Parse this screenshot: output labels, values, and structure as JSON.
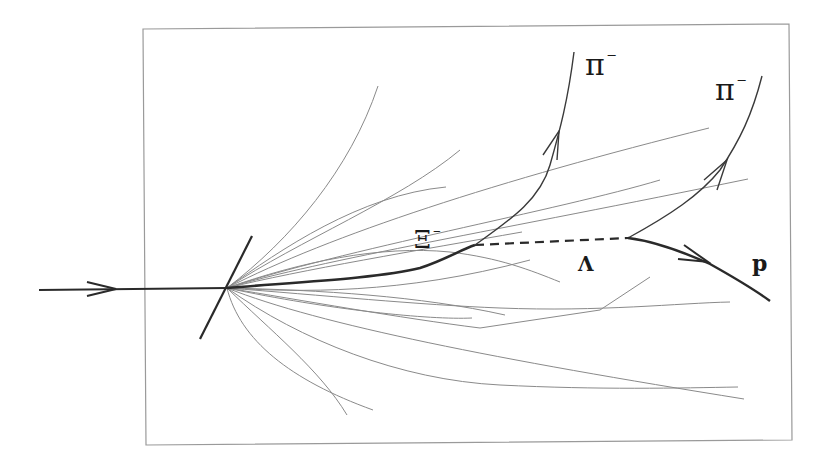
{
  "diagram": {
    "type": "particle-decay-event",
    "colors": {
      "thin_track": "#8a8a8a",
      "thick_track": "#2a2a2a",
      "frame": "#9a9a9a",
      "text": "#1a1a1a"
    },
    "labels": {
      "xi": {
        "symbol": "Ξ",
        "charge": "−"
      },
      "pi1": {
        "symbol": "π",
        "charge": "−"
      },
      "pi2": {
        "symbol": "π",
        "charge": "−"
      },
      "lambda": {
        "symbol": "Λ"
      },
      "proton": {
        "symbol": "p"
      }
    },
    "particles": [
      {
        "name": "incoming-beam",
        "style": "thick",
        "arrow": true
      },
      {
        "name": "Xi-minus",
        "style": "thick",
        "arrow": false
      },
      {
        "name": "Lambda",
        "style": "dashed",
        "arrow": false
      },
      {
        "name": "pi-minus-1",
        "style": "medium",
        "arrow": true
      },
      {
        "name": "pi-minus-2",
        "style": "medium",
        "arrow": true
      },
      {
        "name": "proton",
        "style": "thick",
        "arrow": true
      }
    ]
  }
}
